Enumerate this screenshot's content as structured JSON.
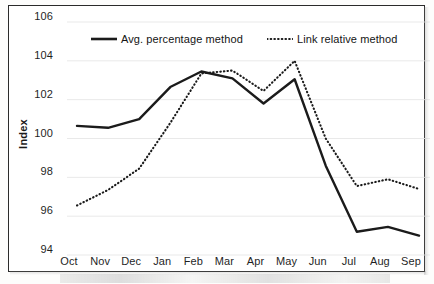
{
  "chart_data": {
    "type": "line",
    "title": "",
    "subtitle": "",
    "xlabel": "",
    "ylabel": "Index",
    "categories": [
      "Oct",
      "Nov",
      "Dec",
      "Jan",
      "Feb",
      "Mar",
      "Apr",
      "May",
      "Jun",
      "Jul",
      "Aug",
      "Sep"
    ],
    "series": [
      {
        "name": "Avg. percentage method",
        "style": "solid",
        "color": "#1b1b1b",
        "values": [
          100.65,
          100.55,
          101.0,
          102.65,
          103.45,
          103.1,
          101.8,
          103.05,
          98.6,
          95.2,
          95.45,
          95.0
        ]
      },
      {
        "name": "Link relative method",
        "style": "dotted",
        "color": "#1b1b1b",
        "values": [
          96.55,
          97.35,
          98.45,
          100.8,
          103.35,
          103.5,
          102.45,
          104.0,
          100.0,
          97.55,
          97.9,
          97.4
        ]
      }
    ],
    "ylim": [
      94,
      106
    ],
    "yticks": [
      94,
      96,
      98,
      100,
      102,
      104,
      106
    ],
    "ytick_labels": [
      "94",
      "96",
      "98",
      "100",
      "102",
      "104",
      "106"
    ],
    "grid": true,
    "grid_axis": "y",
    "legend_position": "top-inside"
  },
  "legend": {
    "entries": [
      {
        "label": "Avg. percentage method",
        "style": "solid"
      },
      {
        "label": "Link relative method",
        "style": "dotted"
      }
    ]
  },
  "axes": {
    "y_title": "Index",
    "y_tick_labels": [
      "106",
      "104",
      "102",
      "100",
      "98",
      "96",
      "94"
    ],
    "x_tick_labels": [
      "Oct",
      "Nov",
      "Dec",
      "Jan",
      "Feb",
      "Mar",
      "Apr",
      "May",
      "Jun",
      "Jul",
      "Aug",
      "Sep"
    ]
  },
  "colors": {
    "series_ink": "#1b1b1b",
    "frame": "#2b2b2b",
    "gridline": "#e9e9e9",
    "text": "#1f1f1f",
    "background": "#ffffff"
  }
}
